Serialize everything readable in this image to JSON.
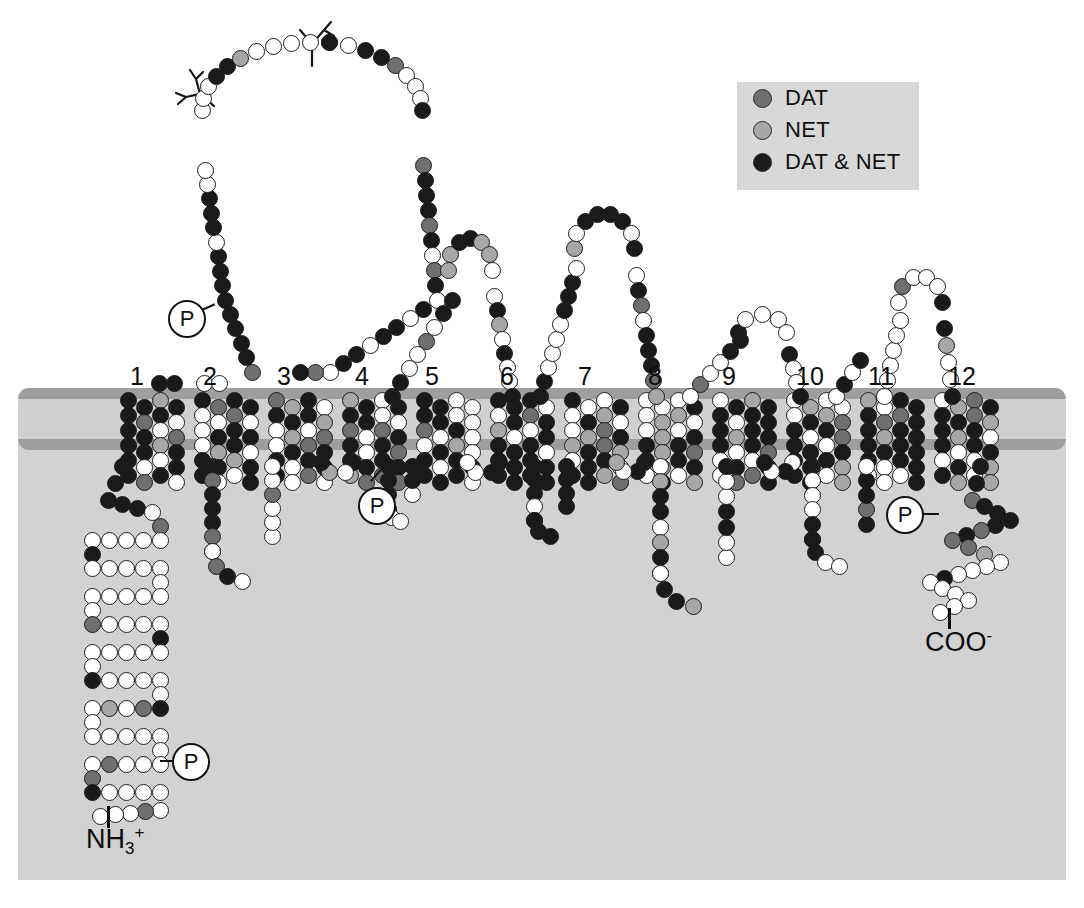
{
  "figure": {
    "type": "protein-topology-diagram",
    "transmembrane_domain_count": 12,
    "background_color": "#ffffff",
    "membrane_color": "#cfcfcf",
    "membrane_leaflet_color": "#9e9e9e",
    "cytoplasm_color": "#d2d2d2"
  },
  "legend": {
    "background": "#d8d8d8",
    "items": [
      {
        "label": "DAT",
        "color": "#706f6f",
        "key": "dat"
      },
      {
        "label": "NET",
        "color": "#a8a7a7",
        "key": "net"
      },
      {
        "label": "DAT & NET",
        "color": "#1a1a1a",
        "key": "both"
      }
    ]
  },
  "tm_numbers": [
    "1",
    "2",
    "3",
    "4",
    "5",
    "6",
    "7",
    "8",
    "9",
    "10",
    "11",
    "12"
  ],
  "termini": {
    "n_terminus": {
      "text": "NH",
      "sub": "3",
      "sup": "+"
    },
    "c_terminus": {
      "text": "COO",
      "sup": "-"
    }
  },
  "phosphorylation_sites": {
    "label": "P",
    "count": 4,
    "locations": [
      "n-terminal-tail",
      "extracellular-loop-2",
      "intracellular-loop-between-tm4-tm5",
      "c-terminal-tail"
    ]
  },
  "glycosylation_sites": {
    "count": 2,
    "location": "extracellular-loop-2"
  },
  "chart_data": {
    "type": "diagram",
    "categories": [
      "DAT",
      "NET",
      "DAT & NET"
    ],
    "values": [
      3,
      3,
      3
    ],
    "legend_position": "top-right"
  }
}
